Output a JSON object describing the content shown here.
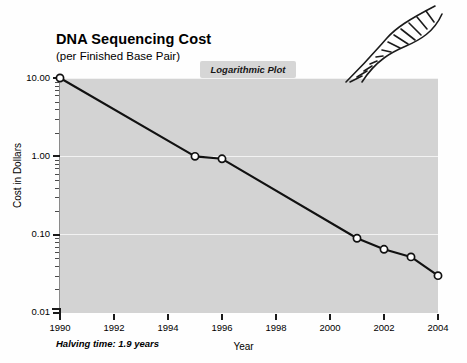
{
  "header": {
    "title": "DNA Sequencing Cost",
    "subtitle": "(per Finished Base Pair)",
    "badge_label": "Logarithmic Plot"
  },
  "footnote": "Halving time: 1.9 years",
  "icons": {
    "dna_helix": "dna-helix-icon"
  },
  "colors": {
    "plot_background": "#d3d3d3",
    "gridline": "#f2f2f2",
    "series_line": "#111111",
    "marker_fill": "#ffffff",
    "badge_background": "#d6d6d6",
    "page_background": "#fefefe"
  },
  "chart_data": {
    "type": "line",
    "title": "DNA Sequencing Cost",
    "subtitle": "(per Finished Base Pair)",
    "annotation": "Logarithmic Plot",
    "footnote": "Halving time: 1.9 years",
    "xlabel": "Year",
    "ylabel": "Cost in Dollars",
    "yscale": "log",
    "xscale": "linear",
    "xlim": [
      1990,
      2004
    ],
    "ylim": [
      0.01,
      10.0
    ],
    "grid": true,
    "grid_axis": "y",
    "legend": false,
    "x": [
      1990,
      1995,
      1996,
      2001,
      2002,
      2003,
      2004
    ],
    "values": [
      10.0,
      1.0,
      0.93,
      0.09,
      0.065,
      0.052,
      0.03
    ],
    "points": [
      {
        "year": 1990,
        "cost": 10.0
      },
      {
        "year": 1995,
        "cost": 1.0
      },
      {
        "year": 1996,
        "cost": 0.93
      },
      {
        "year": 2001,
        "cost": 0.09
      },
      {
        "year": 2002,
        "cost": 0.065
      },
      {
        "year": 2003,
        "cost": 0.052
      },
      {
        "year": 2004,
        "cost": 0.03
      }
    ],
    "xticks": [
      1990,
      1992,
      1994,
      1996,
      1998,
      2000,
      2002,
      2004
    ],
    "xticklabels": [
      "1990",
      "1992",
      "1994",
      "1996",
      "1998",
      "2000",
      "2002",
      "2004"
    ],
    "yticks": [
      0.01,
      0.1,
      1.0,
      10.0
    ],
    "yticklabels": [
      "0.01",
      "0.10",
      "1.00",
      "10.00"
    ]
  }
}
